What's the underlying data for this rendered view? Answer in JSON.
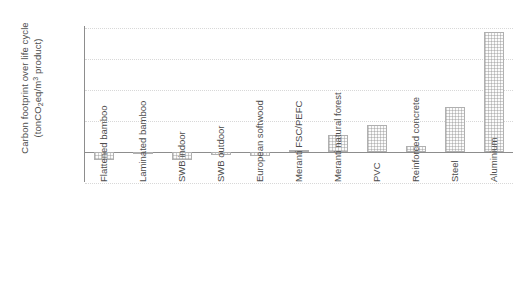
{
  "chart_data": {
    "type": "bar",
    "title": "",
    "xlabel": "",
    "ylabel_line1": "Carbon footprint over life cycle",
    "ylabel_line2_pre": "(tonCO",
    "ylabel_line2_sub": "2",
    "ylabel_line2_mid": "eq/m",
    "ylabel_line2_sup": "3",
    "ylabel_line2_post": " product)",
    "ylabel_plain": "Carbon footprint over life cycle (tonCO2eq/m3 product)",
    "categories": [
      "Flattened bamboo",
      "Laminated bamboo",
      "SWB indoor",
      "SWB outdoor",
      "European softwood",
      "Meranti FSC/PEFC",
      "Meranti natural forest",
      "PVC",
      "Reinforced concrete",
      "Steel",
      "Aluminium"
    ],
    "values": [
      -1.3,
      -0.4,
      -1.3,
      -0.5,
      -0.6,
      0.3,
      2.7,
      4.4,
      1.0,
      7.3,
      19.3
    ],
    "ylim": [
      -5,
      21
    ],
    "yticks": [
      20,
      15,
      10,
      5,
      0,
      -5
    ],
    "ytick_labels": [
      "20",
      "15",
      "10",
      "5",
      "0",
      "-5"
    ],
    "grid": "horizontal-dotted",
    "legend": "none",
    "bar_fill": "#fbfbfb",
    "bar_edge": "#b0b0b0",
    "grid_color": "#d8d8d8",
    "axis_color": "#8d8d8d",
    "text_color": "#4d4d4d"
  }
}
